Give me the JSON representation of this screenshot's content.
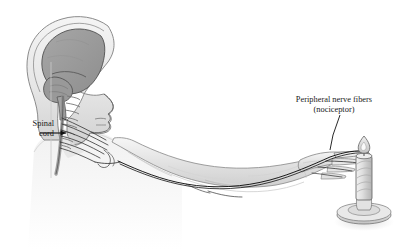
{
  "figure": {
    "style": "grayscale medical line illustration",
    "background_color": "#ffffff"
  },
  "labels": {
    "spinal_cord": {
      "line1": "Spinal",
      "line2": "cord"
    },
    "peripheral": {
      "line1": "Peripheral nerve fibers",
      "line2": "(nociceptor)"
    }
  },
  "colors": {
    "ink": "#1a1a1a",
    "brain_fill": "#9b9b9b",
    "brain_stroke": "#4a4a4a",
    "skin_fill": "#e9e9e9",
    "skin_stroke": "#8d8d8d",
    "body_faint": "#f2f2f2",
    "nerve": "#111111",
    "candle_fill": "#dcdcdc",
    "candle_stroke": "#6e6e6e",
    "flame_fill": "#efefef",
    "shadow": "#e4e4e4"
  },
  "parts": {
    "head": "head-in-profile",
    "brain": "cerebrum-and-cerebellum",
    "brainstem": "brainstem",
    "vertebrae": "cervical-vertebrae",
    "spinal_cord": "spinal-cord",
    "plexus": "brachial-plexus-nerve-fibers",
    "arm": "extended-arm",
    "hand": "hand-with-extended-fingers",
    "candle": "lit-candle",
    "candle_holder": "candle-holder-saucer-base",
    "flame": "candle-flame",
    "nerve_path": "nerve-running-arm-to-fingertip"
  },
  "annotations": {
    "spinal_arrow": "arrow-pointing-right-to-spinal-cord",
    "peripheral_leader": "leader-line-to-finger-nerve-endings"
  }
}
